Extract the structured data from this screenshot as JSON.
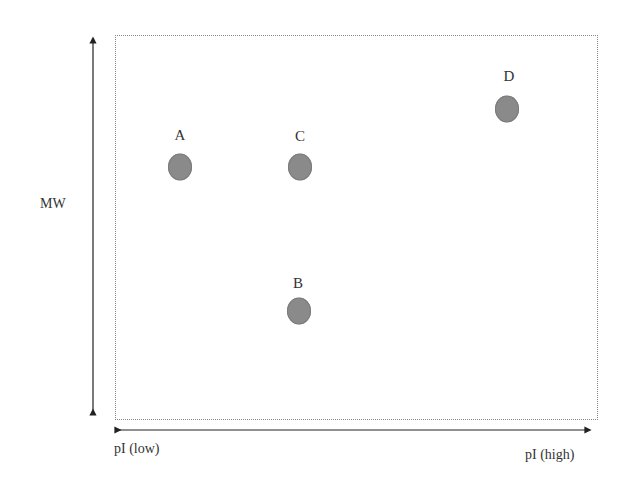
{
  "chart_data": {
    "type": "scatter",
    "title": "",
    "xlabel_low": "pI (low)",
    "xlabel_high": "pI (high)",
    "ylabel": "MW",
    "grid": false,
    "axis_ticks": "none (qualitative axes with double-headed arrows)",
    "points": [
      {
        "label": "A",
        "x": 0.13,
        "y": 0.66
      },
      {
        "label": "C",
        "x": 0.38,
        "y": 0.66
      },
      {
        "label": "B",
        "x": 0.38,
        "y": 0.28
      },
      {
        "label": "D",
        "x": 0.81,
        "y": 0.81
      }
    ],
    "marker_color": "#8a8a8a"
  },
  "axes": {
    "y_label": "MW",
    "x_label_low": "pI (low)",
    "x_label_high": "pI (high)"
  },
  "points": [
    {
      "label": "A",
      "px": 180,
      "py": 167,
      "lx": 180,
      "ly": 135
    },
    {
      "label": "C",
      "px": 300,
      "py": 167,
      "lx": 300,
      "ly": 136
    },
    {
      "label": "B",
      "px": 299,
      "py": 311,
      "lx": 298,
      "ly": 283
    },
    {
      "label": "D",
      "px": 507,
      "py": 109,
      "lx": 509,
      "ly": 76
    }
  ]
}
